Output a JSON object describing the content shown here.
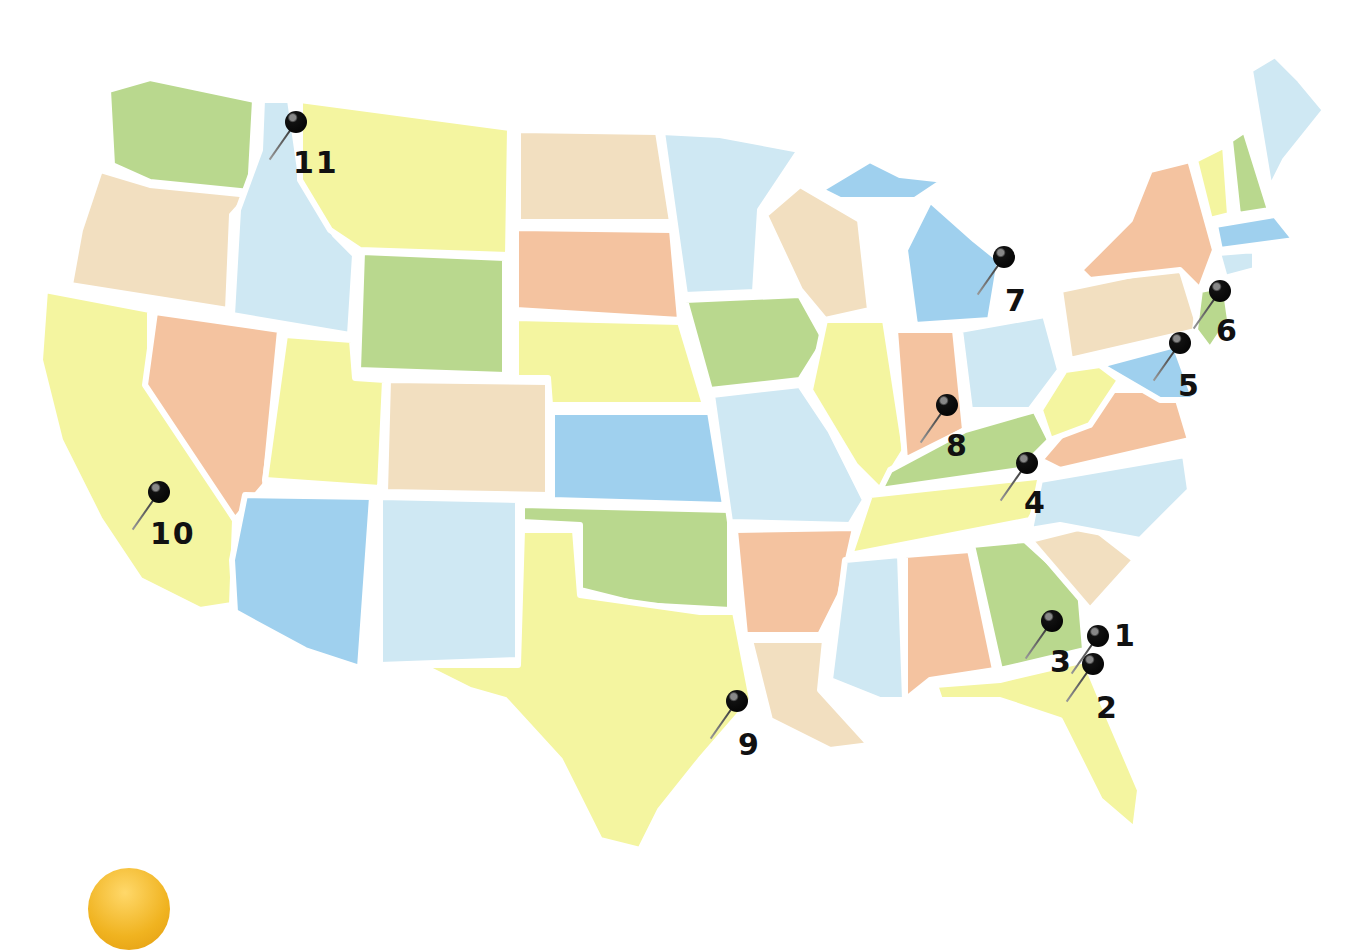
{
  "map": {
    "title": "United States map with numbered pins",
    "colors": {
      "green": "#b9d88e",
      "tan": "#f2dfc0",
      "yellow": "#f4f5a0",
      "lightblue": "#cfe8f3",
      "blue": "#9fd0ee",
      "salmon": "#f4c3a0",
      "background": "#ffffff"
    },
    "pins": [
      {
        "label": "1",
        "x": 1098,
        "y": 636,
        "lx": 1114,
        "ly": 618
      },
      {
        "label": "2",
        "x": 1093,
        "y": 664,
        "lx": 1096,
        "ly": 690
      },
      {
        "label": "3",
        "x": 1052,
        "y": 621,
        "lx": 1050,
        "ly": 644
      },
      {
        "label": "4",
        "x": 1027,
        "y": 463,
        "lx": 1024,
        "ly": 485
      },
      {
        "label": "5",
        "x": 1180,
        "y": 343,
        "lx": 1178,
        "ly": 368
      },
      {
        "label": "6",
        "x": 1220,
        "y": 291,
        "lx": 1216,
        "ly": 313
      },
      {
        "label": "7",
        "x": 1004,
        "y": 257,
        "lx": 1005,
        "ly": 283
      },
      {
        "label": "8",
        "x": 947,
        "y": 405,
        "lx": 946,
        "ly": 428
      },
      {
        "label": "9",
        "x": 737,
        "y": 701,
        "lx": 738,
        "ly": 727
      },
      {
        "label": "10",
        "x": 159,
        "y": 492,
        "lx": 150,
        "ly": 516
      },
      {
        "label": "11",
        "x": 296,
        "y": 122,
        "lx": 293,
        "ly": 145
      }
    ]
  }
}
